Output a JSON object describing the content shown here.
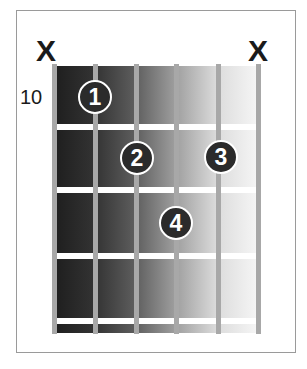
{
  "chord": {
    "start_fret_label": "10",
    "strings": 6,
    "frets_shown": 4,
    "muted_strings": [
      {
        "string": 6,
        "symbol": "X"
      },
      {
        "string": 1,
        "symbol": "X"
      }
    ],
    "fingers": [
      {
        "finger": "1",
        "string": 5,
        "fret": 1
      },
      {
        "finger": "2",
        "string": 4,
        "fret": 2
      },
      {
        "finger": "3",
        "string": 2,
        "fret": 2
      },
      {
        "finger": "4",
        "string": 3,
        "fret": 3
      }
    ]
  },
  "labels": {
    "mute_left": "X",
    "mute_right": "X",
    "fret_number": "10",
    "finger_1": "1",
    "finger_2": "2",
    "finger_3": "3",
    "finger_4": "4"
  },
  "colors": {
    "dot_fill": "#2b2b2b",
    "dot_ring": "#ffffff",
    "string": "#a8a8a8",
    "fret": "#ffffff",
    "gradient_dark": "#1e1e1e",
    "gradient_light": "#f4f4f4",
    "frame_border": "#9a9a9a"
  }
}
